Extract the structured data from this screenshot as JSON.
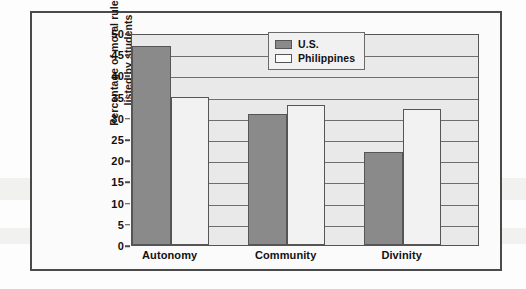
{
  "chart_data": {
    "type": "bar",
    "title": "",
    "xlabel": "",
    "ylabel": "Percentage of moral rules listed by students",
    "ylabel_line1": "Percentage of moral rules",
    "ylabel_line2": "listed by students",
    "categories": [
      "Autonomy",
      "Community",
      "Divinity"
    ],
    "series": [
      {
        "name": "U.S.",
        "color": "#8a8a8a",
        "values": [
          47,
          31,
          22
        ]
      },
      {
        "name": "Philippines",
        "color": "#f2f2f2",
        "values": [
          35,
          33,
          32
        ]
      }
    ],
    "ylim": [
      0,
      50
    ],
    "ytick_values": [
      0,
      5,
      10,
      15,
      20,
      25,
      30,
      35,
      40,
      45,
      50
    ],
    "ytick_labels": [
      "0",
      "5",
      "10",
      "15",
      "20",
      "25",
      "30",
      "35",
      "40",
      "45",
      "50"
    ],
    "grid": true,
    "grid_axis": "y",
    "legend_position": "upper right",
    "legend_entries": [
      "U.S.",
      "Philippines"
    ]
  }
}
